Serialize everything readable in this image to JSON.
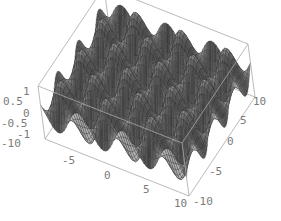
{
  "chart_data": {
    "type": "surface3d",
    "title": "",
    "function": "sin(x)*sin(y)",
    "x_range": [
      -10,
      10
    ],
    "y_range": [
      -10,
      10
    ],
    "z_range": [
      -1,
      1
    ],
    "grid_mesh": true,
    "colors": {
      "surface_light": "#b8b8b8",
      "surface_dark": "#2e2e2e",
      "mesh": "#1e1e1e",
      "box": "#a8a8a8",
      "ticks": "#7a7a7a",
      "background": "#ffffff"
    },
    "axes": {
      "z": {
        "ticks": [
          "1",
          "0.5",
          "0",
          "-0.5",
          "-1"
        ]
      },
      "x": {
        "ticks": [
          "-10",
          "-5",
          "0",
          "5",
          "10"
        ]
      },
      "y": {
        "ticks": [
          "-10",
          "-5",
          "0",
          "5",
          "10"
        ]
      }
    },
    "box_corners_px": {
      "top_back": [
        126,
        16
      ],
      "top_right": [
        258,
        51
      ],
      "top_left": [
        38,
        86
      ],
      "bottom_left": [
        45,
        139
      ],
      "bottom_front": [
        189,
        196
      ],
      "bottom_right": [
        255,
        97
      ]
    }
  }
}
